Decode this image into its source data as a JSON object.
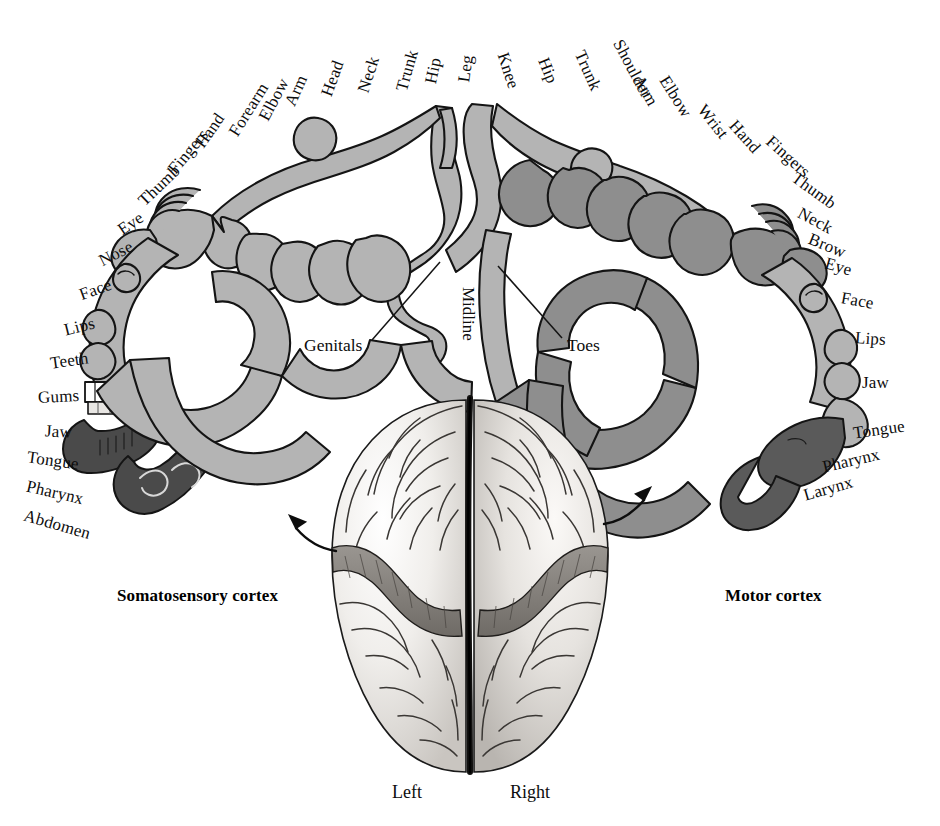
{
  "figure": {
    "background_color": "#ffffff"
  },
  "colors": {
    "ink": "#0d0d0d",
    "outline": "#1a1a1a",
    "somatosensory_fill": "#b4b4b4",
    "motor_fill": "#8e8e8e",
    "tongue_dark": "#4a4a4a",
    "teeth_white": "#ffffff",
    "brain_light": "#f2f0ee",
    "brain_mid": "#cfcbc6",
    "brain_band": "#8a8682",
    "brain_shadow": "#6e6a66"
  },
  "somatosensory": {
    "caption": "Somatosensory cortex",
    "caption_pos": {
      "x": 117,
      "y": 586
    },
    "labels": [
      {
        "text": "Leg",
        "x": 452,
        "y": 60,
        "rot": -82
      },
      {
        "text": "Hip",
        "x": 420,
        "y": 62,
        "rot": -78
      },
      {
        "text": "Trunk",
        "x": 386,
        "y": 62,
        "rot": -74
      },
      {
        "text": "Neck",
        "x": 350,
        "y": 66,
        "rot": -72
      },
      {
        "text": "Head",
        "x": 314,
        "y": 70,
        "rot": -70
      },
      {
        "text": "Arm",
        "x": 280,
        "y": 82,
        "rot": -66
      },
      {
        "text": "Elbow",
        "x": 251,
        "y": 91,
        "rot": -62
      },
      {
        "text": "Forearm",
        "x": 219,
        "y": 101,
        "rot": -58
      },
      {
        "text": "Hand",
        "x": 191,
        "y": 122,
        "rot": -55
      },
      {
        "text": "Fingers",
        "x": 162,
        "y": 143,
        "rot": -50
      },
      {
        "text": "Thumb",
        "x": 134,
        "y": 177,
        "rot": -44
      },
      {
        "text": "Eye",
        "x": 117,
        "y": 215,
        "rot": -34
      },
      {
        "text": "Nose",
        "x": 98,
        "y": 245,
        "rot": -27
      },
      {
        "text": "Face",
        "x": 79,
        "y": 281,
        "rot": -20
      },
      {
        "text": "Lips",
        "x": 64,
        "y": 318,
        "rot": -14
      },
      {
        "text": "Teeth",
        "x": 50,
        "y": 352,
        "rot": -8
      },
      {
        "text": "Gums",
        "x": 38,
        "y": 388,
        "rot": -3
      },
      {
        "text": "Jaw",
        "x": 45,
        "y": 423,
        "rot": 3
      },
      {
        "text": "Tongue",
        "x": 27,
        "y": 452,
        "rot": 8
      },
      {
        "text": "Pharynx",
        "x": 26,
        "y": 484,
        "rot": 13
      },
      {
        "text": "Abdomen",
        "x": 23,
        "y": 516,
        "rot": 16
      }
    ],
    "callout": {
      "text": "Genitals",
      "x": 304,
      "y": 335,
      "line": {
        "x1": 372,
        "y1": 340,
        "x2": 440,
        "y2": 262
      }
    },
    "arrow": {
      "from": {
        "x": 330,
        "y": 545
      },
      "to": {
        "x": 287,
        "y": 519
      }
    }
  },
  "motor": {
    "caption": "Motor cortex",
    "caption_pos": {
      "x": 725,
      "y": 586
    },
    "labels": [
      {
        "text": "Knee",
        "x": 490,
        "y": 62,
        "rot": 72
      },
      {
        "text": "Hip",
        "x": 535,
        "y": 62,
        "rot": 68
      },
      {
        "text": "Trunk",
        "x": 567,
        "y": 62,
        "rot": 66
      },
      {
        "text": "Shoulder",
        "x": 601,
        "y": 60,
        "rot": 62
      },
      {
        "text": "Arm",
        "x": 630,
        "y": 82,
        "rot": 60
      },
      {
        "text": "Elbow",
        "x": 653,
        "y": 88,
        "rot": 58
      },
      {
        "text": "Wrist",
        "x": 694,
        "y": 113,
        "rot": 52
      },
      {
        "text": "Hand",
        "x": 726,
        "y": 128,
        "rot": 48
      },
      {
        "text": "Fingers",
        "x": 762,
        "y": 148,
        "rot": 42
      },
      {
        "text": "Thumb",
        "x": 789,
        "y": 182,
        "rot": 36
      },
      {
        "text": "Neck",
        "x": 797,
        "y": 212,
        "rot": 28
      },
      {
        "text": "Brow",
        "x": 808,
        "y": 237,
        "rot": 22
      },
      {
        "text": "Eye",
        "x": 825,
        "y": 258,
        "rot": 16
      },
      {
        "text": "Face",
        "x": 841,
        "y": 292,
        "rot": 10
      },
      {
        "text": "Lips",
        "x": 855,
        "y": 330,
        "rot": 4
      },
      {
        "text": "Jaw",
        "x": 862,
        "y": 374,
        "rot": 0
      },
      {
        "text": "Tongue",
        "x": 853,
        "y": 421,
        "rot": -8
      },
      {
        "text": "Pharynx",
        "x": 822,
        "y": 452,
        "rot": -13
      },
      {
        "text": "Larynx",
        "x": 803,
        "y": 480,
        "rot": -16
      }
    ],
    "callout": {
      "text": "Toes",
      "x": 567,
      "y": 335,
      "line": {
        "x1": 562,
        "y1": 338,
        "x2": 498,
        "y2": 266
      }
    },
    "arrow": {
      "from": {
        "x": 608,
        "y": 518
      },
      "to": {
        "x": 650,
        "y": 490
      }
    }
  },
  "midline": {
    "text": "Midline",
    "x": 478,
    "y": 287
  },
  "hemispheres": [
    {
      "text": "Left",
      "x": 392,
      "y": 782
    },
    {
      "text": "Right",
      "x": 510,
      "y": 782
    }
  ]
}
